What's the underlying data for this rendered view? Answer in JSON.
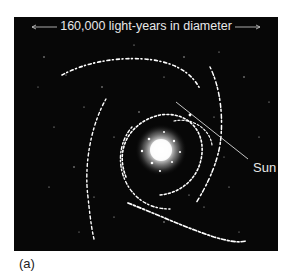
{
  "figure": {
    "scale_label": "160,000 light-years in diameter",
    "sun_label": "Sun",
    "caption": "(a)"
  },
  "colors": {
    "background": "#070707",
    "stars": "#ffffff",
    "label_text": "#e8e8e8",
    "caption_text": "#222222"
  }
}
